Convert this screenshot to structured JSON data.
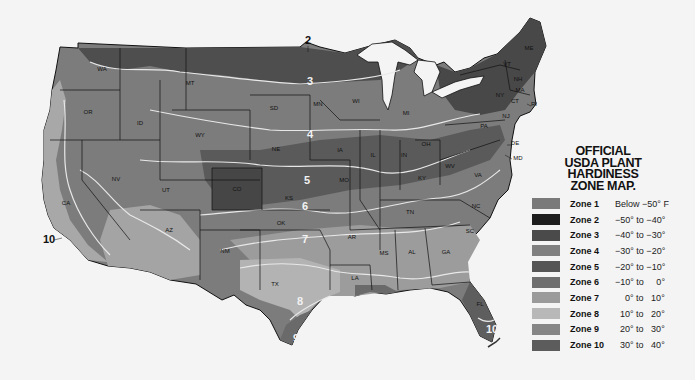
{
  "title": {
    "line1": "OFFICIAL",
    "line2": "USDA PLANT",
    "line3": "HARDINESS",
    "line4": "ZONE MAP."
  },
  "legend": [
    {
      "zone": "Zone 1",
      "range": "Below −50° F",
      "color": "#7a7a7a"
    },
    {
      "zone": "Zone 2",
      "range": "−50° to −40°",
      "color": "#1e1e1e"
    },
    {
      "zone": "Zone 3",
      "range": "−40° to −30°",
      "color": "#4a4a4a"
    },
    {
      "zone": "Zone 4",
      "range": "−30° to −20°",
      "color": "#808080"
    },
    {
      "zone": "Zone 5",
      "range": "−20° to −10°",
      "color": "#555555"
    },
    {
      "zone": "Zone 6",
      "range": "−10° to     0°",
      "color": "#6e6e6e"
    },
    {
      "zone": "Zone 7",
      "range": "    0° to   10°",
      "color": "#9a9a9a"
    },
    {
      "zone": "Zone 8",
      "range": "  10° to   20°",
      "color": "#b8b8b8"
    },
    {
      "zone": "Zone 9",
      "range": "  20° to   30°",
      "color": "#868686"
    },
    {
      "zone": "Zone 10",
      "range": "  30° to   40°",
      "color": "#5c5c5c"
    }
  ],
  "map": {
    "states": [
      {
        "abbr": "WA",
        "x": 102,
        "y": 71
      },
      {
        "abbr": "OR",
        "x": 88,
        "y": 114
      },
      {
        "abbr": "CA",
        "x": 66,
        "y": 205
      },
      {
        "abbr": "ID",
        "x": 140,
        "y": 125
      },
      {
        "abbr": "NV",
        "x": 116,
        "y": 181
      },
      {
        "abbr": "MT",
        "x": 190,
        "y": 85
      },
      {
        "abbr": "WY",
        "x": 200,
        "y": 137
      },
      {
        "abbr": "UT",
        "x": 166,
        "y": 192
      },
      {
        "abbr": "AZ",
        "x": 169,
        "y": 232
      },
      {
        "abbr": "CO",
        "x": 237,
        "y": 191
      },
      {
        "abbr": "NM",
        "x": 225,
        "y": 253
      },
      {
        "abbr": "SD",
        "x": 274,
        "y": 110
      },
      {
        "abbr": "NE",
        "x": 276,
        "y": 151
      },
      {
        "abbr": "KS",
        "x": 289,
        "y": 200
      },
      {
        "abbr": "OK",
        "x": 281,
        "y": 225
      },
      {
        "abbr": "TX",
        "x": 275,
        "y": 286
      },
      {
        "abbr": "MN",
        "x": 318,
        "y": 106
      },
      {
        "abbr": "IA",
        "x": 340,
        "y": 152
      },
      {
        "abbr": "MO",
        "x": 344,
        "y": 182
      },
      {
        "abbr": "AR",
        "x": 352,
        "y": 239
      },
      {
        "abbr": "LA",
        "x": 355,
        "y": 280
      },
      {
        "abbr": "WI",
        "x": 356,
        "y": 103
      },
      {
        "abbr": "IL",
        "x": 373,
        "y": 157
      },
      {
        "abbr": "MS",
        "x": 384,
        "y": 255
      },
      {
        "abbr": "MI",
        "x": 406,
        "y": 115
      },
      {
        "abbr": "IN",
        "x": 404,
        "y": 157
      },
      {
        "abbr": "KY",
        "x": 422,
        "y": 180
      },
      {
        "abbr": "TN",
        "x": 410,
        "y": 214
      },
      {
        "abbr": "AL",
        "x": 412,
        "y": 254
      },
      {
        "abbr": "GA",
        "x": 446,
        "y": 254
      },
      {
        "abbr": "FL",
        "x": 480,
        "y": 306
      },
      {
        "abbr": "SC",
        "x": 470,
        "y": 233
      },
      {
        "abbr": "NC",
        "x": 476,
        "y": 208
      },
      {
        "abbr": "VA",
        "x": 478,
        "y": 177
      },
      {
        "abbr": "WV",
        "x": 450,
        "y": 168
      },
      {
        "abbr": "OH",
        "x": 426,
        "y": 146
      },
      {
        "abbr": "PA",
        "x": 484,
        "y": 128
      },
      {
        "abbr": "NY",
        "x": 500,
        "y": 97
      },
      {
        "abbr": "VT",
        "x": 507,
        "y": 66
      },
      {
        "abbr": "NH",
        "x": 518,
        "y": 81
      },
      {
        "abbr": "ME",
        "x": 529,
        "y": 50
      },
      {
        "abbr": "MA",
        "x": 520,
        "y": 92
      },
      {
        "abbr": "CT",
        "x": 515,
        "y": 103
      },
      {
        "abbr": "NJ",
        "x": 506,
        "y": 118
      },
      {
        "abbr": "RI",
        "x": 534,
        "y": 106
      },
      {
        "abbr": "DE",
        "x": 515,
        "y": 145
      },
      {
        "abbr": "MD",
        "x": 518,
        "y": 160
      }
    ],
    "zone_labels": [
      {
        "text": "2",
        "x": 308,
        "y": 44,
        "dark": true
      },
      {
        "text": "3",
        "x": 310,
        "y": 85,
        "dark": false
      },
      {
        "text": "4",
        "x": 310,
        "y": 138,
        "dark": false
      },
      {
        "text": "5",
        "x": 307,
        "y": 184,
        "dark": false
      },
      {
        "text": "6",
        "x": 305,
        "y": 210,
        "dark": false
      },
      {
        "text": "7",
        "x": 305,
        "y": 243,
        "dark": false
      },
      {
        "text": "8",
        "x": 300,
        "y": 305,
        "dark": false
      },
      {
        "text": "9",
        "x": 296,
        "y": 342,
        "dark": false
      },
      {
        "text": "10",
        "x": 49,
        "y": 243,
        "dark": true
      },
      {
        "text": "10",
        "x": 492,
        "y": 333,
        "dark": false
      }
    ]
  }
}
